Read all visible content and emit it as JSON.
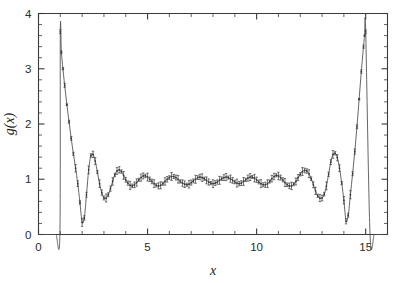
{
  "chart_data": {
    "type": "line",
    "title": "",
    "subtitle": "",
    "xlabel": "x",
    "ylabel": "g(x)",
    "xlim": [
      0,
      16
    ],
    "ylim": [
      0,
      4
    ],
    "xticks": [
      0,
      5,
      10,
      15
    ],
    "yticks": [
      0,
      1,
      2,
      3,
      4
    ],
    "xticklabels": [
      "0",
      "5",
      "10",
      "15"
    ],
    "yticklabels": [
      "0",
      "1",
      "2",
      "3",
      "4"
    ],
    "x_minor_tick_step": 1,
    "y_minor_tick_step": 0.2,
    "grid": false,
    "legend": null,
    "legend_position": "none",
    "annotations": [],
    "series": [
      {
        "name": "g(x)",
        "style": "line-with-points-and-errorbars",
        "marker": "point",
        "line_color": "#4a4a4a",
        "x": [
          0.0,
          0.2,
          0.4,
          0.6,
          0.8,
          0.98,
          1.0,
          1.05,
          1.12,
          1.2,
          1.3,
          1.4,
          1.5,
          1.6,
          1.7,
          1.8,
          1.9,
          2.0,
          2.1,
          2.2,
          2.3,
          2.4,
          2.5,
          2.6,
          2.7,
          2.8,
          2.9,
          3.0,
          3.1,
          3.2,
          3.3,
          3.4,
          3.5,
          3.6,
          3.7,
          3.8,
          3.9,
          4.0,
          4.1,
          4.2,
          4.3,
          4.4,
          4.5,
          4.6,
          4.7,
          4.8,
          4.9,
          5.0,
          5.1,
          5.2,
          5.3,
          5.4,
          5.5,
          5.6,
          5.7,
          5.8,
          5.9,
          6.0,
          6.1,
          6.2,
          6.3,
          6.4,
          6.5,
          6.6,
          6.7,
          6.8,
          6.9,
          7.0,
          7.1,
          7.2,
          7.3,
          7.4,
          7.5,
          7.6,
          7.7,
          7.8,
          7.9,
          8.0,
          8.1,
          8.2,
          8.3,
          8.4,
          8.5,
          8.6,
          8.7,
          8.8,
          8.9,
          9.0,
          9.1,
          9.2,
          9.3,
          9.4,
          9.5,
          9.6,
          9.7,
          9.8,
          9.9,
          10.0,
          10.1,
          10.2,
          10.3,
          10.4,
          10.5,
          10.6,
          10.7,
          10.8,
          10.9,
          11.0,
          11.1,
          11.2,
          11.3,
          11.4,
          11.5,
          11.6,
          11.7,
          11.8,
          11.9,
          12.0,
          12.1,
          12.2,
          12.3,
          12.4,
          12.5,
          12.6,
          12.7,
          12.8,
          12.9,
          13.0,
          13.1,
          13.2,
          13.3,
          13.4,
          13.5,
          13.6,
          13.7,
          13.8,
          13.9,
          14.0,
          14.1,
          14.2,
          14.3,
          14.4,
          14.5,
          14.6,
          14.7,
          14.8,
          14.9,
          14.95,
          15.0,
          15.2,
          15.4,
          15.6,
          15.8,
          16.0
        ],
        "y": [
          0.0,
          0.0,
          0.0,
          0.0,
          0.0,
          0.0,
          3.67,
          3.3,
          3.0,
          2.7,
          2.35,
          2.04,
          1.74,
          1.46,
          1.2,
          0.92,
          0.58,
          0.22,
          0.3,
          0.72,
          1.17,
          1.43,
          1.45,
          1.33,
          1.13,
          0.92,
          0.76,
          0.66,
          0.66,
          0.72,
          0.83,
          0.96,
          1.08,
          1.15,
          1.17,
          1.14,
          1.07,
          0.99,
          0.93,
          0.89,
          0.88,
          0.9,
          0.94,
          0.99,
          1.03,
          1.06,
          1.06,
          1.04,
          1.0,
          0.96,
          0.92,
          0.89,
          0.88,
          0.89,
          0.92,
          0.96,
          1.0,
          1.03,
          1.05,
          1.05,
          1.03,
          1.0,
          0.96,
          0.93,
          0.91,
          0.9,
          0.91,
          0.94,
          0.97,
          1.0,
          1.03,
          1.04,
          1.03,
          1.01,
          0.98,
          0.95,
          0.93,
          0.92,
          0.93,
          0.95,
          0.98,
          1.01,
          1.03,
          1.04,
          1.03,
          1.01,
          0.98,
          0.95,
          0.93,
          0.92,
          0.93,
          0.96,
          0.99,
          1.02,
          1.04,
          1.04,
          1.02,
          0.99,
          0.95,
          0.92,
          0.9,
          0.9,
          0.92,
          0.96,
          1.01,
          1.05,
          1.07,
          1.06,
          1.03,
          0.99,
          0.94,
          0.9,
          0.88,
          0.88,
          0.91,
          0.96,
          1.03,
          1.09,
          1.14,
          1.16,
          1.15,
          1.1,
          1.01,
          0.9,
          0.79,
          0.7,
          0.66,
          0.66,
          0.73,
          0.88,
          1.09,
          1.31,
          1.45,
          1.47,
          1.39,
          1.2,
          0.93,
          0.62,
          0.24,
          0.35,
          0.72,
          1.1,
          1.5,
          1.95,
          2.45,
          2.95,
          3.4,
          3.6,
          3.67,
          0.0,
          0.0,
          0.0,
          0.0,
          0.0
        ],
        "errorbar_typical": 0.05
      }
    ],
    "features": {
      "peak_left_x": 1.0,
      "peak_left_y": 3.67,
      "peak_right_x": 15.0,
      "peak_right_y": 3.67,
      "first_minimum_x": 2.0,
      "first_minimum_y": 0.22,
      "second_maximum_x": 2.45,
      "second_maximum_y": 1.45,
      "asymptote": 1.0,
      "zero_region_left": [
        0.0,
        1.0
      ],
      "zero_region_right": [
        15.0,
        16.0
      ]
    }
  },
  "figure": {
    "background_color": "#ffffff",
    "line_color": "#4a4a4a",
    "axis_color": "#3a3a3a",
    "text_color": "#2b2b2b"
  }
}
